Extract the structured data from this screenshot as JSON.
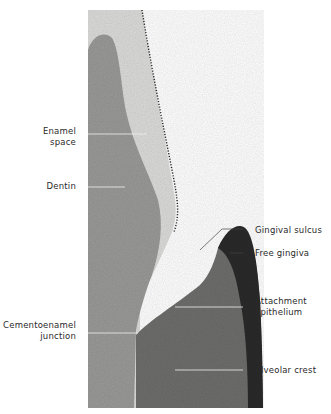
{
  "figure": {
    "type": "histology-micrograph",
    "colors": {
      "background": "#ffffff",
      "dentin": "#9a9a98",
      "enamel_space": "#dcdcda",
      "gingiva_dark": "#2a2a2a",
      "connective_tissue": "#6e6e6c",
      "leader_line": "#f0f0f0",
      "label_text": "#2a2a2a"
    }
  },
  "labels": {
    "enamel_space_line1": "Enamel",
    "enamel_space_line2": "space",
    "dentin": "Dentin",
    "cej_line1": "Cementoenamel",
    "cej_line2": "junction",
    "gingival_sulcus": "Gingival sulcus",
    "free_gingiva": "Free gingiva",
    "attachment_epithelium_line1": "Attachment",
    "attachment_epithelium_line2": "epithelium",
    "alveolar_crest": "Alveolar crest"
  }
}
